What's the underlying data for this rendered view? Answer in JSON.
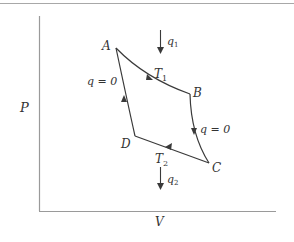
{
  "diagram": {
    "type": "pressure-volume cycle (Carnot cycle)",
    "colors": {
      "line": "#3a3a3a",
      "axis": "#9a9a9a",
      "border": "#a8a8a8",
      "text": "#333333"
    },
    "axes": {
      "y_label": "P",
      "x_label": "V"
    },
    "points": {
      "A": {
        "label": "A"
      },
      "B": {
        "label": "B"
      },
      "C": {
        "label": "C"
      },
      "D": {
        "label": "D"
      }
    },
    "processes": [
      {
        "from": "A",
        "to": "B",
        "kind": "isotherm",
        "label": "T",
        "subscript": "1"
      },
      {
        "from": "B",
        "to": "C",
        "kind": "adiabat",
        "label": "q = 0"
      },
      {
        "from": "C",
        "to": "D",
        "kind": "isotherm",
        "label": "T",
        "subscript": "2"
      },
      {
        "from": "D",
        "to": "A",
        "kind": "adiabat",
        "label": "q = 0"
      }
    ],
    "heat_flows": {
      "in": {
        "label": "q",
        "subscript": "1"
      },
      "out": {
        "label": "q",
        "subscript": "2"
      }
    }
  }
}
